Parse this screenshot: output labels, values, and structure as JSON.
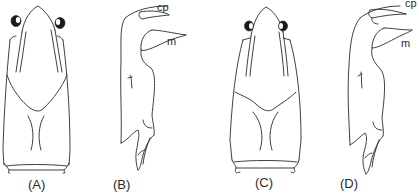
{
  "figure": {
    "panels": [
      {
        "id": "A",
        "label": "(A)",
        "view": "dorsal"
      },
      {
        "id": "B",
        "label": "(B)",
        "view": "lateral",
        "annotations": [
          "cp",
          "m"
        ]
      },
      {
        "id": "C",
        "label": "(C)",
        "view": "dorsal"
      },
      {
        "id": "D",
        "label": "(D)",
        "view": "lateral",
        "annotations": [
          "cp",
          "m"
        ]
      }
    ],
    "annotations": {
      "b_cp": "cp",
      "b_m": "m",
      "d_cp": "cp",
      "d_m": "m"
    },
    "colors": {
      "line": "#2a2a2a",
      "background": "#ffffff"
    }
  }
}
